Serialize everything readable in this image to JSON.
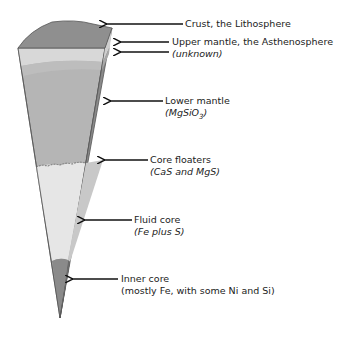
{
  "colors": {
    "crust_top": "#8f8f8f",
    "upper_mantle_front": "#d6d6d6",
    "upper_mantle_band": "#bdbdbd",
    "lower_mantle_front": "#b5b5b5",
    "side_face": "#8a8a8a",
    "core_floaters_edge": "#e8e8e8",
    "fluid_core_front": "#e6e6e6",
    "fluid_core_side": "#c4c4c4",
    "inner_core_front": "#8a8a8a",
    "inner_core_side": "#6a6a6a",
    "outline": "#555555",
    "arrow": "#111111"
  },
  "labels": [
    {
      "id": "crust",
      "main": "Crust, the Lithosphere",
      "sub": ""
    },
    {
      "id": "upper-mantle",
      "main": "Upper mantle, the Asthenosphere",
      "sub": "(unknown)"
    },
    {
      "id": "lower-mantle",
      "main": "Lower mantle",
      "sub": "(MgSiO",
      "sub_subscript": "3",
      "sub_tail": ")"
    },
    {
      "id": "core-floaters",
      "main": "Core floaters",
      "sub": "(CaS and MgS)"
    },
    {
      "id": "fluid-core",
      "main": "Fluid core",
      "sub": "(Fe plus S)"
    },
    {
      "id": "inner-core",
      "main": "Inner core",
      "sub": "(mostly Fe, with some Ni and Si)"
    }
  ]
}
